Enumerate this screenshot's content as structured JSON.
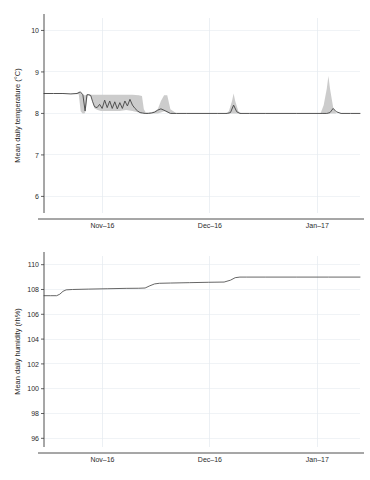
{
  "figure": {
    "background_color": "#ffffff",
    "line_color": "#4a4a4a",
    "band_color": "#c9c9c9",
    "grid_color": "#e9eef2",
    "axis_color": "#3a3a3a"
  },
  "chart_data": [
    {
      "id": "temperature",
      "type": "line",
      "title": "",
      "xlabel": "",
      "ylabel": "Mean daily temperature (°C)",
      "ylim": [
        5.6,
        10.3
      ],
      "yticks": [
        6,
        7,
        8,
        9,
        10
      ],
      "ytick_labels": [
        "6",
        "7",
        "8",
        "9",
        "10"
      ],
      "xlim": [
        0,
        100
      ],
      "xticks": [
        18.5,
        52.5,
        86.5
      ],
      "xtick_labels": [
        "Nov–16",
        "Dec–16",
        "Jan–17"
      ],
      "grid": true,
      "legend": "none",
      "series": [
        {
          "name": "mean daily temperature",
          "x": [
            0.0,
            3.0,
            6.0,
            8.5,
            10.5,
            11.5,
            12.3,
            13.0,
            13.6,
            14.2,
            14.8,
            15.4,
            16.0,
            16.8,
            17.6,
            18.4,
            19.2,
            20.0,
            20.8,
            21.6,
            22.4,
            23.2,
            24.0,
            24.8,
            25.6,
            26.4,
            27.2,
            28.0,
            28.8,
            29.6,
            30.4,
            31.2,
            32.0,
            33.0,
            34.0,
            35.0,
            36.0,
            37.0,
            38.5,
            40.0,
            42.0,
            45.0,
            50.0,
            55.0,
            58.0,
            59.0,
            60.0,
            61.0,
            62.0,
            65.0,
            70.0,
            80.0,
            88.0,
            89.5,
            90.5,
            91.5,
            92.5,
            94.0,
            97.0,
            100.0
          ],
          "y": [
            8.48,
            8.48,
            8.48,
            8.47,
            8.48,
            8.52,
            8.45,
            8.06,
            8.45,
            8.45,
            8.43,
            8.28,
            8.16,
            8.14,
            8.22,
            8.12,
            8.32,
            8.14,
            8.3,
            8.12,
            8.28,
            8.11,
            8.26,
            8.12,
            8.3,
            8.18,
            8.34,
            8.2,
            8.12,
            8.06,
            8.02,
            8.01,
            8.0,
            8.0,
            8.01,
            8.03,
            8.08,
            8.11,
            8.06,
            8.0,
            8.0,
            8.0,
            8.0,
            8.0,
            8.0,
            8.02,
            8.2,
            8.04,
            8.0,
            8.0,
            8.0,
            8.0,
            8.0,
            8.0,
            8.02,
            8.12,
            8.04,
            8.0,
            8.0,
            8.0
          ]
        }
      ],
      "band": {
        "name": "uncertainty interval",
        "x": [
          0.0,
          8.0,
          10.0,
          11.0,
          11.6,
          12.2,
          12.8,
          13.2,
          13.8,
          14.4,
          15.0,
          16.0,
          17.0,
          18.0,
          20.0,
          22.0,
          24.0,
          26.0,
          28.0,
          30.0,
          31.0,
          31.6,
          32.2,
          33.0,
          34.0,
          35.0,
          36.0,
          37.0,
          38.0,
          39.0,
          40.0,
          42.0,
          50.0,
          57.5,
          58.5,
          59.5,
          60.0,
          60.5,
          61.5,
          62.5,
          70.0,
          80.0,
          87.5,
          88.5,
          89.5,
          90.0,
          90.5,
          91.5,
          92.5,
          100.0
        ],
        "lower": [
          8.48,
          8.47,
          8.47,
          8.46,
          8.05,
          8.0,
          8.0,
          8.05,
          8.44,
          8.43,
          8.4,
          8.12,
          8.08,
          8.06,
          8.06,
          8.06,
          8.06,
          8.08,
          8.06,
          8.02,
          8.0,
          8.0,
          8.0,
          8.0,
          8.0,
          8.0,
          8.0,
          8.02,
          8.05,
          8.02,
          8.0,
          8.0,
          8.0,
          8.0,
          8.0,
          8.0,
          8.0,
          8.0,
          8.0,
          8.0,
          8.0,
          8.0,
          8.0,
          8.0,
          8.0,
          8.0,
          8.0,
          8.0,
          8.0,
          8.0
        ],
        "upper": [
          8.48,
          8.47,
          8.48,
          8.52,
          8.5,
          8.46,
          8.44,
          8.44,
          8.46,
          8.46,
          8.45,
          8.45,
          8.45,
          8.45,
          8.45,
          8.45,
          8.45,
          8.45,
          8.45,
          8.44,
          8.42,
          8.1,
          8.02,
          8.02,
          8.03,
          8.05,
          8.1,
          8.3,
          8.44,
          8.44,
          8.1,
          8.0,
          8.0,
          8.0,
          8.05,
          8.3,
          8.48,
          8.3,
          8.05,
          8.0,
          8.0,
          8.0,
          8.0,
          8.2,
          8.6,
          8.9,
          8.6,
          8.15,
          8.0,
          8.0
        ]
      }
    },
    {
      "id": "humidity",
      "type": "line",
      "title": "",
      "xlabel": "",
      "ylabel": "Mean daily humidity (rh%)",
      "ylim": [
        95.3,
        110.7
      ],
      "yticks": [
        96,
        98,
        100,
        102,
        104,
        106,
        108,
        110
      ],
      "ytick_labels": [
        "96",
        "98",
        "100",
        "102",
        "104",
        "106",
        "108",
        "110"
      ],
      "xlim": [
        0,
        100
      ],
      "xticks": [
        18.5,
        52.5,
        86.5
      ],
      "xtick_labels": [
        "Nov–16",
        "Dec–16",
        "Jan–17"
      ],
      "grid": true,
      "legend": "none",
      "series": [
        {
          "name": "mean daily humidity",
          "x": [
            0.0,
            2.0,
            4.0,
            5.0,
            6.0,
            7.0,
            9.0,
            14.0,
            20.0,
            26.0,
            30.0,
            32.0,
            33.5,
            35.0,
            36.5,
            40.0,
            46.0,
            52.0,
            57.0,
            59.0,
            60.5,
            62.0,
            64.0,
            70.0,
            80.0,
            90.0,
            100.0
          ],
          "y": [
            107.5,
            107.5,
            107.5,
            107.62,
            107.85,
            107.97,
            108.0,
            108.03,
            108.06,
            108.09,
            108.1,
            108.12,
            108.3,
            108.45,
            108.5,
            108.52,
            108.55,
            108.58,
            108.6,
            108.75,
            108.95,
            109.0,
            109.0,
            109.0,
            109.0,
            109.0,
            109.0
          ]
        }
      ]
    }
  ]
}
